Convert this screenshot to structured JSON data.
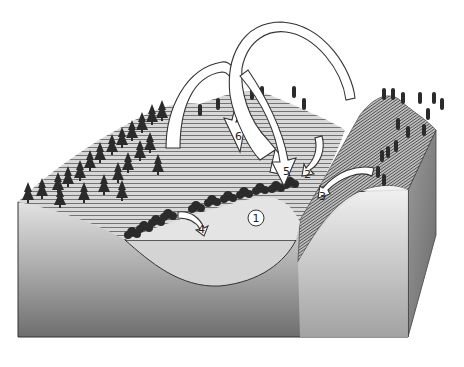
{
  "diagram": {
    "type": "block-diagram",
    "colors": {
      "background": "#ffffff",
      "block_front_top": "#e2e2e2",
      "block_front_bottom": "#7a7a7a",
      "block_side": "#8a8a8a",
      "contour_lines": "#555555",
      "trees": "#2b2b2b",
      "arrow_fill": "#ffffff",
      "arrow_stroke": "#333333",
      "lake_surface": "#e6e6e6"
    },
    "labels": [
      {
        "id": "1",
        "text": "1",
        "description": "Lake (circled label on water surface)"
      },
      {
        "id": "2",
        "text": "2",
        "description": "Short arrow from slope into lake near shoreline vegetation"
      },
      {
        "id": "3",
        "text": "3",
        "description": "Arrow from right steep hillside into lake"
      },
      {
        "id": "4",
        "text": "4",
        "description": "Small arrow from left shoreline vegetation into lake"
      },
      {
        "id": "5",
        "text": "5",
        "description": "Large arching arrow descending onto lake shore"
      },
      {
        "id": "6",
        "text": "6",
        "description": "Large arching arrow descending onto left hillside"
      }
    ],
    "caption": ""
  }
}
